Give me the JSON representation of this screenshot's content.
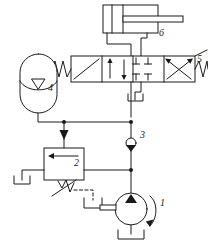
{
  "diagram": {
    "type": "hydraulic-schematic",
    "line_color": "#1a1a1a",
    "fill_color": "#ffffff",
    "background": "#ffffff",
    "callouts": [
      {
        "id": "1",
        "label": "1",
        "component": "hydraulic-pump"
      },
      {
        "id": "2",
        "label": "2",
        "component": "pressure-relief-valve"
      },
      {
        "id": "3",
        "label": "3",
        "component": "check-valve"
      },
      {
        "id": "4",
        "label": "4",
        "component": "accumulator"
      },
      {
        "id": "5",
        "label": "5",
        "component": "directional-control-valve"
      },
      {
        "id": "6",
        "label": "6",
        "component": "double-acting-cylinder"
      }
    ],
    "components": {
      "pump": {
        "name": "hydraulic-pump",
        "label": "1",
        "symbol": "circle-with-filled-triangle",
        "rotation_arrow": true
      },
      "relief_valve": {
        "name": "pressure-relief-valve",
        "label": "2",
        "symbol": "box-with-left-arrow-and-spring",
        "pilot_line": "dashed"
      },
      "check_valve": {
        "name": "check-valve",
        "label": "3",
        "symbol": "ball-and-seat"
      },
      "accumulator": {
        "name": "accumulator",
        "label": "4",
        "symbol": "bladder-accumulator"
      },
      "directional_valve": {
        "name": "directional-control-valve",
        "label": "5",
        "symbol": "4-position-4-way-spring-centered",
        "positions": 4,
        "ports": 4
      },
      "cylinder": {
        "name": "double-acting-cylinder",
        "label": "6",
        "symbol": "double-acting-cylinder-single-rod"
      },
      "tanks": [
        {
          "name": "tank-relief-outlet"
        },
        {
          "name": "tank-pilot-drain"
        },
        {
          "name": "tank-pump-suction"
        },
        {
          "name": "tank-valve-return"
        }
      ]
    }
  }
}
